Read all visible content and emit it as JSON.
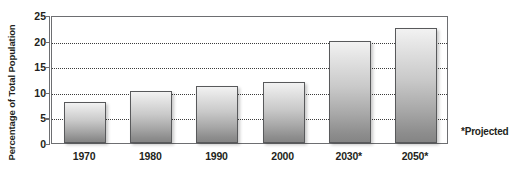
{
  "chart_data": {
    "type": "bar",
    "title": "",
    "xlabel": "",
    "ylabel": "Percentage of Total Population",
    "categories": [
      "1970",
      "1980",
      "1990",
      "2000",
      "2030*",
      "2050*"
    ],
    "values": [
      8,
      10.2,
      11.2,
      12,
      20,
      22.5
    ],
    "ylim": [
      0,
      25
    ],
    "ytick_labels": [
      "0",
      "5",
      "10",
      "15",
      "20",
      "25"
    ],
    "ytick_values": [
      0,
      5,
      10,
      15,
      20,
      25
    ],
    "grid": "horizontal-dotted",
    "legend": "none",
    "annotations": [
      "*Projected"
    ],
    "bar_fill": "#c9c9c9",
    "bar_outline": "#58595b",
    "axis_color": "#6d6e71",
    "gridline_color": "#3c3c3c"
  },
  "axes": {
    "y_title": "Percentage of Total Population",
    "y_ticks": [
      {
        "label": "25",
        "value": 25
      },
      {
        "label": "20",
        "value": 20
      },
      {
        "label": "15",
        "value": 15
      },
      {
        "label": "10",
        "value": 10
      },
      {
        "label": "5",
        "value": 5
      },
      {
        "label": "0",
        "value": 0
      }
    ]
  },
  "bars": [
    {
      "label": "1970",
      "value": 8
    },
    {
      "label": "1980",
      "value": 10.2
    },
    {
      "label": "1990",
      "value": 11.2
    },
    {
      "label": "2000",
      "value": 12
    },
    {
      "label": "2030*",
      "value": 20
    },
    {
      "label": "2050*",
      "value": 22.5
    }
  ],
  "footnote": {
    "text": "*Projected"
  }
}
